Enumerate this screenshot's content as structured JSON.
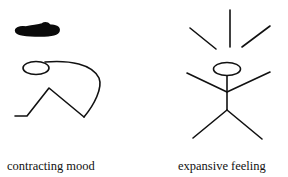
{
  "figures": {
    "left": {
      "caption": "contracting mood",
      "elements": [
        "dark-cloud",
        "head",
        "curved-back",
        "bent-legs"
      ]
    },
    "right": {
      "caption": "expansive feeling",
      "elements": [
        "radiating-lines",
        "head",
        "body",
        "raised-arms",
        "spread-legs"
      ]
    }
  },
  "colors": {
    "stroke": "#111111",
    "background": "#ffffff"
  }
}
